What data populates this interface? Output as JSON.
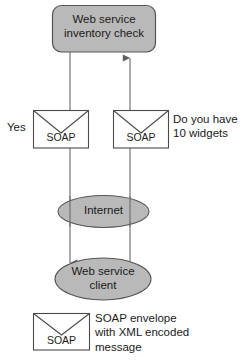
{
  "diagram": {
    "title_text": "Web service inventory check",
    "colors": {
      "node_fill": "#b9b9b9",
      "node_stroke": "#555555",
      "envelope_fill": "#ffffff",
      "envelope_stroke": "#4a4a4a",
      "connector_stroke": "#6b6b6b",
      "text": "#1a1a1a",
      "background": "#ffffff"
    },
    "nodes": {
      "service": {
        "shape": "rounded-rectangle",
        "label_line1": "Web service",
        "label_line2": "inventory check"
      },
      "internet": {
        "shape": "ellipse",
        "label": "Internet"
      },
      "client": {
        "shape": "ellipse",
        "label_line1": "Web service",
        "label_line2": "client"
      }
    },
    "envelopes": {
      "left": {
        "label": "SOAP"
      },
      "right": {
        "label": "SOAP"
      },
      "legend": {
        "label": "SOAP"
      }
    },
    "annotations": {
      "response_label": "Yes",
      "request_line1": "Do you have",
      "request_line2": "10 widgets"
    },
    "legend": {
      "line1": "SOAP envelope",
      "line2": "with XML encoded",
      "line3": "message"
    },
    "flows": [
      {
        "name": "response-flow",
        "direction": "downward",
        "from": "service",
        "to": "client",
        "label": "Yes"
      },
      {
        "name": "request-flow",
        "direction": "upward",
        "from": "client",
        "to": "service",
        "label": "Do you have 10 widgets"
      }
    ]
  }
}
